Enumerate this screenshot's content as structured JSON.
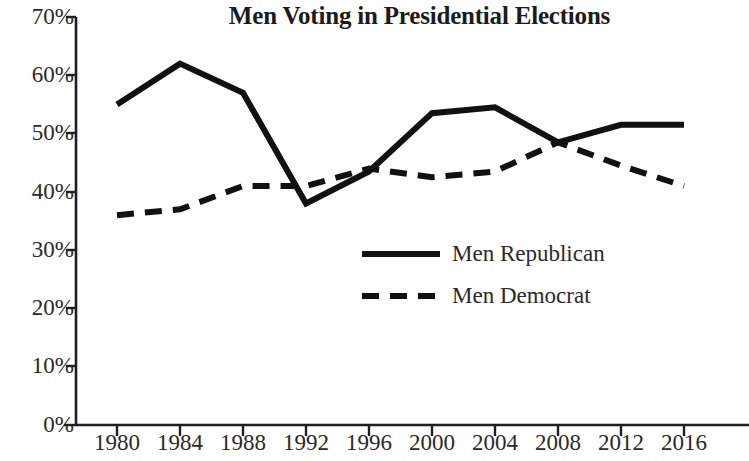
{
  "chart_data": {
    "type": "line",
    "title": "Men Voting in Presidential Elections",
    "xlabel": "",
    "ylabel": "",
    "categories": [
      "1980",
      "1984",
      "1988",
      "1992",
      "1996",
      "2000",
      "2004",
      "2008",
      "2012",
      "2016"
    ],
    "x": [
      1980,
      1984,
      1988,
      1992,
      1996,
      2000,
      2004,
      2008,
      2012,
      2016
    ],
    "series": [
      {
        "name": "Men Republican",
        "style": "solid",
        "color": "#111111",
        "values": [
          55,
          62,
          57,
          38,
          43.5,
          53.5,
          54.5,
          48.5,
          51.5,
          51.5
        ]
      },
      {
        "name": "Men Democrat",
        "style": "dashed",
        "color": "#111111",
        "values": [
          36,
          37,
          41,
          41,
          44,
          42.5,
          43.5,
          48.5,
          44.5,
          41
        ]
      }
    ],
    "ylim": [
      0,
      70
    ],
    "ytick_values": [
      0,
      10,
      20,
      30,
      40,
      50,
      60,
      70
    ],
    "ytick_labels": [
      "0%",
      "10%",
      "20%",
      "30%",
      "40%",
      "50%",
      "60%",
      "70%"
    ],
    "xtick_labels": [
      "1980",
      "1984",
      "1988",
      "1992",
      "1996",
      "2000",
      "2004",
      "2008",
      "2012",
      "2016"
    ],
    "grid": false,
    "legend_position": "center",
    "legend": [
      {
        "label": "Men Republican",
        "style": "solid"
      },
      {
        "label": "Men Democrat",
        "style": "dashed"
      }
    ]
  }
}
